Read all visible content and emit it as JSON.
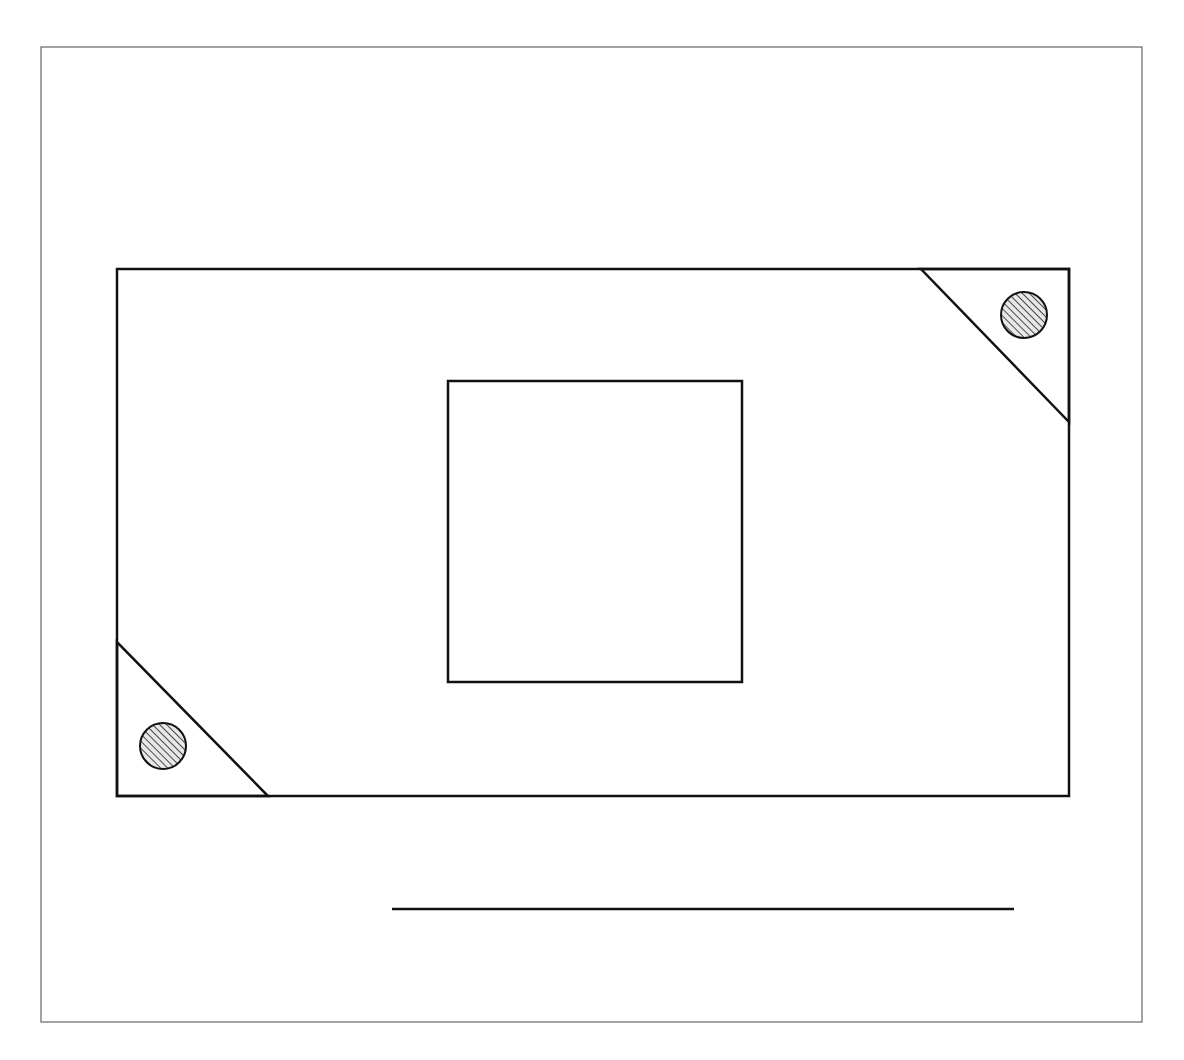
{
  "diagram": {
    "type": "line-drawing",
    "colors": {
      "stroke": "#111111",
      "frame": "#666666",
      "background": "#ffffff",
      "hatch": "#222222",
      "circle_fill": "#e8e8e8"
    },
    "frame": {
      "x": 41,
      "y": 47,
      "width": 1101,
      "height": 975
    },
    "outer_rect": {
      "x": 117,
      "y": 269,
      "width": 952,
      "height": 527
    },
    "inner_square": {
      "x": 448,
      "y": 381,
      "width": 294,
      "height": 301
    },
    "corner_triangles": [
      {
        "position": "top-right",
        "points": "921,269 1069,269 1069,422"
      },
      {
        "position": "bottom-left",
        "points": "117,642 117,796 268,796"
      }
    ],
    "hatched_circles": [
      {
        "position": "top-right",
        "cx": 1024,
        "cy": 315,
        "r": 23
      },
      {
        "position": "bottom-left",
        "cx": 163,
        "cy": 746,
        "r": 23
      }
    ],
    "bottom_line": {
      "x1": 392,
      "y1": 909,
      "x2": 1014,
      "y2": 909
    }
  }
}
